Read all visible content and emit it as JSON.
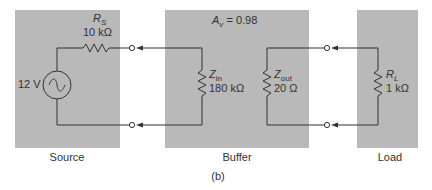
{
  "figure": {
    "caption": "(b)",
    "blocks": [
      {
        "id": "source",
        "label": "Source"
      },
      {
        "id": "buffer",
        "label": "Buffer"
      },
      {
        "id": "load",
        "label": "Load"
      }
    ]
  },
  "source": {
    "voltage": "12 V",
    "resistor_name": "R",
    "resistor_sub": "S",
    "resistor_value": "10 kΩ"
  },
  "buffer": {
    "gain_symbol": "A",
    "gain_sub": "v",
    "gain_value": " = 0.98",
    "zin_name": "Z",
    "zin_sub": "in",
    "zin_value": "180 kΩ",
    "zout_name": "Z",
    "zout_sub": "out",
    "zout_value": "20 Ω"
  },
  "load": {
    "resistor_name": "R",
    "resistor_sub": "L",
    "resistor_value": "1 kΩ"
  },
  "colors": {
    "block_fill": "#b9b9b9",
    "wire": "#333333"
  }
}
